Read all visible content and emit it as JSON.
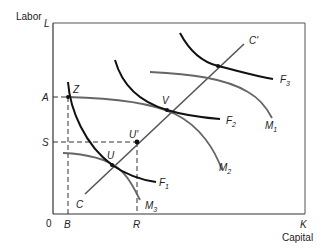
{
  "diagram": {
    "axis_labels": {
      "y_title": "Labor",
      "x_title": "Capital",
      "y_axis_end": "L",
      "x_axis_end": "K",
      "origin": "0"
    },
    "y_ticks": [
      "A",
      "S"
    ],
    "x_ticks": [
      "B",
      "R"
    ],
    "points": {
      "z": "Z",
      "v": "V",
      "u": "U",
      "u_prime": "U'"
    },
    "line_labels": {
      "c": "C",
      "c_prime": "C'"
    },
    "curves": {
      "f1": {
        "letter": "F",
        "sub": "1"
      },
      "f2": {
        "letter": "F",
        "sub": "2"
      },
      "f3": {
        "letter": "F",
        "sub": "3"
      },
      "m1": {
        "letter": "M",
        "sub": "1"
      },
      "m2": {
        "letter": "M",
        "sub": "2"
      },
      "m3": {
        "letter": "M",
        "sub": "3"
      }
    },
    "colors": {
      "isoquant_f": "#111111",
      "isoquant_m": "#666666",
      "axis": "#333333"
    }
  }
}
